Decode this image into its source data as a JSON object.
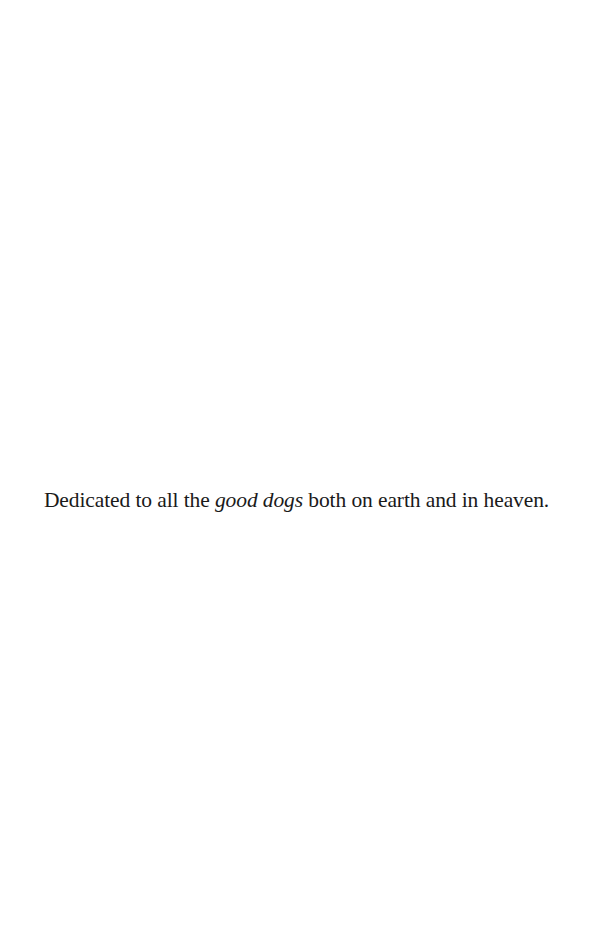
{
  "page": {
    "background": "#ffffff",
    "text_color": "#1a1a1a"
  },
  "dedication": {
    "before": "Dedicated to all the ",
    "emphasis": "good dogs",
    "after": " both on earth and in heaven."
  }
}
